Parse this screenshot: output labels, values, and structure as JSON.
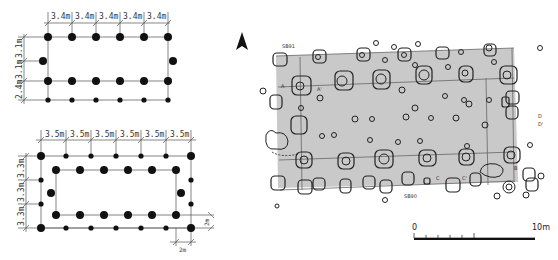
{
  "figure": {
    "plan_a": {
      "spans_x": [
        "3.4m",
        "3.4m",
        "3.4m",
        "3.4m",
        "3.4m"
      ],
      "spans_y": [
        "3.1m",
        "3.1m",
        "2.4m"
      ]
    },
    "plan_b": {
      "spans_x": [
        "3.5m",
        "3.5m",
        "3.5m",
        "3.5m",
        "3.5m",
        "3.5m"
      ],
      "spans_y": [
        "3.3m",
        "3.3m",
        "3.3m"
      ],
      "offset_x": "2m",
      "offset_y": "2m"
    },
    "site_plan": {
      "north_arrow": "north-arrow",
      "building_labels": {
        "top": "SB91",
        "bottom": "SB90"
      },
      "section_labels": {
        "a": "A",
        "a_prime": "A'",
        "c": "C",
        "c_prime": "C'",
        "d": "D",
        "d_prime": "D'",
        "b": "B"
      },
      "fill_color": "#c9c9c9"
    },
    "scale_bar": {
      "start": "0",
      "end": "10m"
    }
  }
}
